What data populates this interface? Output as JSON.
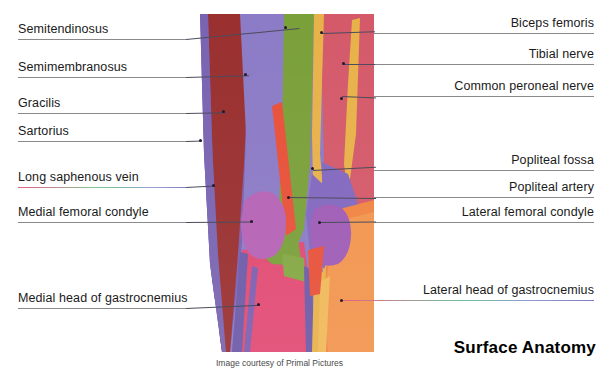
{
  "title": "Surface Anatomy",
  "caption": "Image courtesy of Primal Pictures",
  "labels_left": [
    {
      "id": "semitendinosus",
      "text": "Semitendinosus"
    },
    {
      "id": "semimembranosus",
      "text": "Semimembranosus"
    },
    {
      "id": "gracilis",
      "text": "Gracilis"
    },
    {
      "id": "sartorius",
      "text": "Sartorius"
    },
    {
      "id": "long-saphenous-vein",
      "text": "Long saphenous vein"
    },
    {
      "id": "medial-femoral-condyle",
      "text": "Medial femoral condyle"
    },
    {
      "id": "medial-head-of-gastrocnemius",
      "text": "Medial head of gastrocnemius"
    }
  ],
  "labels_right": [
    {
      "id": "biceps-femoris",
      "text": "Biceps femoris"
    },
    {
      "id": "tibial-nerve",
      "text": "Tibial nerve"
    },
    {
      "id": "common-peroneal-nerve",
      "text": "Common peroneal nerve"
    },
    {
      "id": "popliteal-fossa",
      "text": "Popliteal fossa"
    },
    {
      "id": "popliteal-artery",
      "text": "Popliteal artery"
    },
    {
      "id": "lateral-femoral-condyle",
      "text": "Lateral femoral condyle"
    },
    {
      "id": "lateral-head-of-gastrocnemius",
      "text": "Lateral head of gastrocnemius"
    }
  ],
  "colors": {
    "background": "#ffffff",
    "text": "#1a1a1a",
    "rule": "#8a8a8a",
    "leader": "#4c4c5c",
    "accent_pink": "#e8607f",
    "accent_green": "#6fc49a",
    "accent_blue": "#7b7fc4"
  },
  "anatomy": {
    "view": "posterior knee, right leg",
    "regions": [
      {
        "name": "semitendinosus",
        "color": "#7e5fb0"
      },
      {
        "name": "semimembranosus",
        "color": "#9a3030"
      },
      {
        "name": "gracilis",
        "color": "#8c7bc6"
      },
      {
        "name": "sartorius",
        "color": "#8c7bc6"
      },
      {
        "name": "long-saphenous-vein",
        "color": "#6d5aa8"
      },
      {
        "name": "medial-femoral-condyle",
        "color": "#b563b5"
      },
      {
        "name": "medial-head-of-gastrocnemius",
        "color": "#e04a72"
      },
      {
        "name": "biceps-femoris",
        "color": "#d45a6a"
      },
      {
        "name": "tibial-nerve",
        "color": "#e8b24a"
      },
      {
        "name": "common-peroneal-nerve",
        "color": "#e8b24a"
      },
      {
        "name": "popliteal-fossa",
        "color": "#8268bf"
      },
      {
        "name": "popliteal-artery",
        "color": "#e8513a"
      },
      {
        "name": "lateral-femoral-condyle",
        "color": "#9e5cb5"
      },
      {
        "name": "lateral-head-of-gastrocnemius",
        "color": "#f08442"
      },
      {
        "name": "iliotibial-band",
        "color": "#7aa03a"
      }
    ]
  }
}
